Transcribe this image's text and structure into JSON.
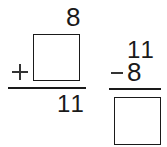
{
  "problems": [
    {
      "type": "addition",
      "top_addend": "8",
      "bottom_addend": "",
      "operator": "+",
      "sum": "11"
    },
    {
      "type": "subtraction",
      "minuend": "11",
      "subtrahend": "8",
      "operator": "−",
      "difference": ""
    }
  ]
}
